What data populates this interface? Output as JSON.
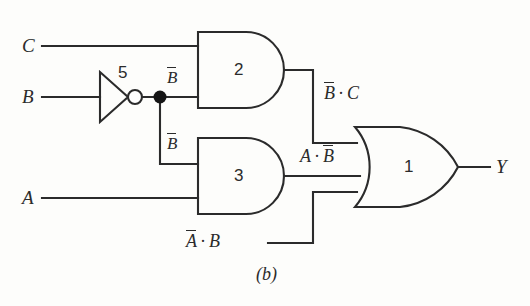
{
  "figure": {
    "caption": "(b)",
    "type": "logic-circuit-diagram"
  },
  "inputs": [
    {
      "name": "input-c",
      "label": "C"
    },
    {
      "name": "input-b",
      "label": "B"
    },
    {
      "name": "input-a",
      "label": "A"
    }
  ],
  "output": {
    "name": "output-y",
    "label": "Y"
  },
  "gates": [
    {
      "id": "5",
      "type": "NOT",
      "number": "5"
    },
    {
      "id": "2",
      "type": "AND",
      "number": "2"
    },
    {
      "id": "3",
      "type": "AND",
      "number": "3"
    },
    {
      "id": "1",
      "type": "OR",
      "number": "1"
    }
  ],
  "wire_labels": {
    "not_out_top": {
      "base": "B",
      "overline": true,
      "text": "B"
    },
    "not_out_bottom": {
      "base": "B",
      "overline": true,
      "text": "B"
    },
    "and2_out": {
      "first": "B",
      "op": "·",
      "second": "C"
    },
    "and3_out": {
      "first": "A",
      "op": "·",
      "second": "B"
    },
    "or_third_input": {
      "first": "A",
      "op": "·",
      "second": "B"
    }
  },
  "expressions": {
    "and2_output": "B̅ · C",
    "and3_output": "A · B̅",
    "or_third_input": "A̅ · B",
    "final_output": "Y"
  },
  "colors": {
    "line": "#2b2b2b",
    "background": "#fdfdfb",
    "junction": "#151515",
    "bubble_fill": "#ffffff"
  }
}
